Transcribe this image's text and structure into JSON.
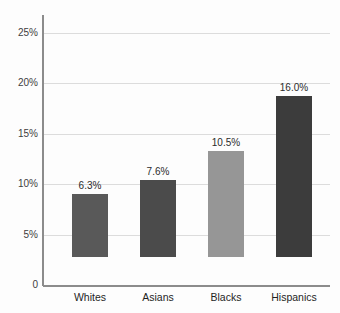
{
  "chart_data": {
    "type": "bar",
    "title": "",
    "subtitle": "",
    "xlabel": "",
    "ylabel": "",
    "categories": [
      "Whites",
      "Asians",
      "Blacks",
      "Hispanics"
    ],
    "values": [
      6.3,
      7.6,
      10.5,
      16.0
    ],
    "value_labels": [
      "6.3%",
      "7.6%",
      "10.5%",
      "16.0%"
    ],
    "bar_colors": [
      "#595959",
      "#4b4b4b",
      "#969696",
      "#3c3c3c"
    ],
    "ylim": [
      0,
      26
    ],
    "yticks": [
      0,
      5,
      10,
      15,
      20,
      25
    ],
    "ytick_labels": [
      "0",
      "5%",
      "10%",
      "15%",
      "20%",
      "25%"
    ],
    "grid": true,
    "grid_axis": "y",
    "legend": "none",
    "background_color": "#fdfdfd",
    "axis_color": "#8c8c8c",
    "gridline_color": "#dcdcdc",
    "text_color": "#2b2b2b"
  }
}
